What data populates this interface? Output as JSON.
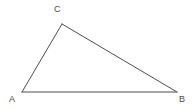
{
  "figure": {
    "kind": "geometry-diagram",
    "shape_name": "triangle",
    "width": 194,
    "height": 108,
    "background_color": "#ffffff",
    "stroke_color": "#4d4d4d",
    "stroke_width": 1,
    "label_color": "#4a4a4a",
    "label_font_size": 9
  },
  "vertices": [
    {
      "id": "A",
      "label": "A",
      "x": 22,
      "y": 92,
      "label_x": 9,
      "label_y": 95
    },
    {
      "id": "B",
      "label": "B",
      "x": 177,
      "y": 92,
      "label_x": 179,
      "label_y": 95
    },
    {
      "id": "C",
      "label": "C",
      "x": 62,
      "y": 24,
      "label_x": 54,
      "label_y": 5
    }
  ],
  "edges": [
    {
      "id": "AC",
      "from": "A",
      "to": "C",
      "x1": 22,
      "y1": 92,
      "x2": 62,
      "y2": 24
    },
    {
      "id": "CB",
      "from": "C",
      "to": "B",
      "x1": 62,
      "y1": 24,
      "x2": 177,
      "y2": 92
    },
    {
      "id": "AB",
      "from": "A",
      "to": "B",
      "x1": 22,
      "y1": 92,
      "x2": 177,
      "y2": 92
    }
  ],
  "polygon_points": "22,92 62,24 177,92"
}
